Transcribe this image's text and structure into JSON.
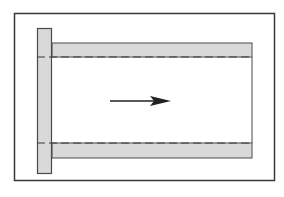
{
  "diagram": {
    "colors": {
      "stroke": "#3a3a3a",
      "fill_shaded": "#d9d9d9",
      "background": "#ffffff",
      "dashed": "#3a3a3a"
    },
    "arrow_direction": "right"
  }
}
